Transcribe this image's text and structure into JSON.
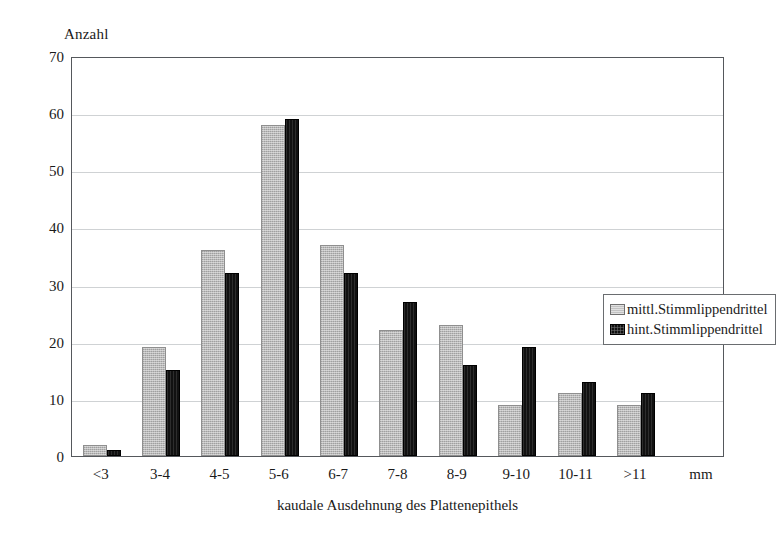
{
  "chart_data": {
    "type": "bar",
    "title": "",
    "xlabel": "kaudale Ausdehnung des Plattenepithels",
    "ylabel": "Anzahl",
    "x_unit": "mm",
    "categories": [
      "<3",
      "3-4",
      "4-5",
      "5-6",
      "6-7",
      "7-8",
      "8-9",
      "9-10",
      "10-11",
      ">11"
    ],
    "series": [
      {
        "name": "mittl.Stimmlippendrittel",
        "color": "#b9b9b9",
        "values": [
          2,
          19,
          36,
          58,
          37,
          22,
          23,
          9,
          11,
          9
        ]
      },
      {
        "name": "hint.Stimmlippendrittel",
        "color": "#111111",
        "values": [
          1,
          15,
          32,
          59,
          32,
          27,
          16,
          19,
          13,
          11
        ]
      }
    ],
    "ylim": [
      0,
      70
    ],
    "y_ticks": [
      0,
      10,
      20,
      30,
      40,
      50,
      60,
      70
    ],
    "grid": true,
    "legend_position": "inside-right"
  },
  "legend": {
    "entries": [
      {
        "label": "mittl.Stimmlippendrittel",
        "swatch": "gray-swatch-icon"
      },
      {
        "label": "hint.Stimmlippendrittel",
        "swatch": "black-swatch-icon"
      }
    ]
  }
}
